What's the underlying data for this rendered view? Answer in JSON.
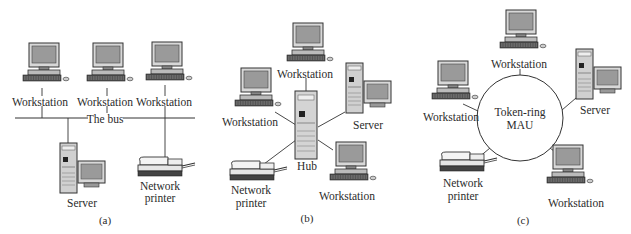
{
  "figure": {
    "panels": [
      {
        "id": "a",
        "caption": "(a)",
        "topology": "bus",
        "labels": {
          "workstation_1": "Workstation",
          "workstation_2": "Workstation",
          "workstation_3": "Workstation",
          "bus": "The bus",
          "server": "Server",
          "printer_line1": "Network",
          "printer_line2": "printer"
        }
      },
      {
        "id": "b",
        "caption": "(b)",
        "topology": "star",
        "labels": {
          "workstation_top": "Workstation",
          "workstation_left": "Workstation",
          "server": "Server",
          "hub": "Hub",
          "printer_line1": "Network",
          "printer_line2": "printer",
          "workstation_bottom": "Workstation"
        }
      },
      {
        "id": "c",
        "caption": "(c)",
        "topology": "token-ring",
        "labels": {
          "workstation_top": "Workstation",
          "workstation_left": "Workstation",
          "server": "Server",
          "mau_line1": "Token-ring",
          "mau_line2": "MAU",
          "printer_line1": "Network",
          "printer_line2": "printer",
          "workstation_bottom": "Workstation"
        }
      }
    ]
  }
}
